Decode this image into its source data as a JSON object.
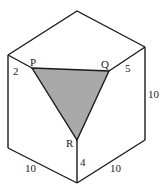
{
  "figure": {
    "colors": {
      "line": "#1a1a1a",
      "shaded": "#a9a9a9",
      "background": "#ffffff"
    },
    "vertices": {
      "top": [
        77,
        11
      ],
      "left_top": [
        8,
        55
      ],
      "right_top": [
        145,
        47
      ],
      "left_bottom": [
        8,
        148
      ],
      "right_bottom": [
        145,
        140
      ],
      "bottom": [
        77,
        183
      ],
      "P": [
        32,
        68
      ],
      "Q": [
        109,
        71
      ],
      "R": [
        77,
        140
      ]
    },
    "labels": {
      "P": "P",
      "Q": "Q",
      "R": "R",
      "left_segment": "2",
      "right_segment": "5",
      "right_edge": "10",
      "front_segment": "4",
      "bottom_left_edge": "10",
      "bottom_right_edge": "10"
    }
  }
}
